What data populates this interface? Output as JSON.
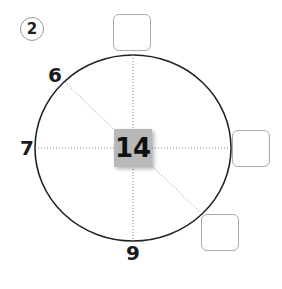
{
  "question_number": "2",
  "center_value": "14",
  "labels": [
    {
      "id": "label-6",
      "text": "6"
    },
    {
      "id": "label-7",
      "text": "7"
    },
    {
      "id": "label-9",
      "text": "9"
    }
  ],
  "answer_boxes": [
    {
      "id": "top",
      "value": ""
    },
    {
      "id": "right",
      "value": ""
    },
    {
      "id": "bottom-right",
      "value": ""
    }
  ]
}
